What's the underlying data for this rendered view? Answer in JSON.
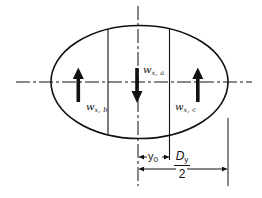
{
  "diagram": {
    "type": "elliptical cross-section with distributed load arrows",
    "line_color": "#111111",
    "background": "#ffffff",
    "labels": {
      "load_a": {
        "symbol": "w",
        "subscript": "x, a",
        "direction": "down"
      },
      "load_b": {
        "symbol": "w",
        "subscript": "x, b",
        "direction": "up"
      },
      "load_c": {
        "symbol": "w",
        "subscript": "x, c",
        "direction": "up"
      }
    },
    "dimensions": {
      "offset": {
        "symbol": "y",
        "subscript": "0"
      },
      "half_width": {
        "numerator": "D",
        "numerator_subscript": "y",
        "denominator": "2"
      }
    }
  }
}
